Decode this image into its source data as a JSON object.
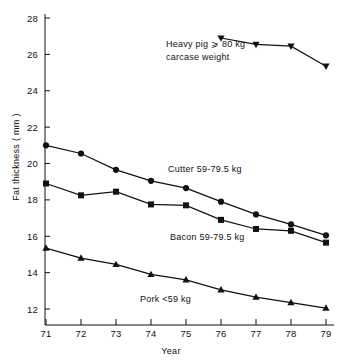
{
  "chart_data": {
    "type": "line",
    "title": "",
    "xlabel": "Year",
    "ylabel": "Fat thickness ( mm )",
    "x": [
      71,
      72,
      73,
      74,
      75,
      76,
      77,
      78,
      79
    ],
    "xticklabels": [
      "71",
      "72",
      "73",
      "74",
      "75",
      "76",
      "77",
      "78",
      "79"
    ],
    "xlim": [
      70.6,
      79.4
    ],
    "ylim": [
      11.2,
      28.4
    ],
    "yticks": [
      12,
      14,
      16,
      18,
      20,
      22,
      24,
      26,
      28
    ],
    "yticklabels": [
      "12",
      "14",
      "16",
      "18",
      "20",
      "22",
      "24",
      "26",
      "28"
    ],
    "grid": false,
    "legend": "annotations-on-plot",
    "line_color": "#111111",
    "series": [
      {
        "name": "Heavy pig ⩾ 80 kg carcase weight",
        "marker": "triangle-down",
        "x": [
          76,
          77,
          78,
          79
        ],
        "values": [
          26.9,
          26.55,
          26.45,
          25.35
        ],
        "label_lines": [
          "Heavy pig ⩾ 80 kg",
          "carcase  weight"
        ]
      },
      {
        "name": "Cutter 59-79.5 kg",
        "marker": "circle",
        "x": [
          71,
          72,
          73,
          74,
          75,
          76,
          77,
          78,
          79
        ],
        "values": [
          21.0,
          20.55,
          19.65,
          19.05,
          18.65,
          17.9,
          17.2,
          16.65,
          16.05
        ],
        "label_lines": [
          "Cutter 59-79.5 kg"
        ]
      },
      {
        "name": "Bacon 59-79.5 kg",
        "marker": "square",
        "x": [
          71,
          72,
          73,
          74,
          75,
          76,
          77,
          78,
          79
        ],
        "values": [
          18.9,
          18.25,
          18.45,
          17.75,
          17.7,
          16.9,
          16.4,
          16.3,
          15.65
        ],
        "label_lines": [
          "Bacon 59-79.5 kg"
        ]
      },
      {
        "name": "Pork <59 kg",
        "marker": "triangle-up",
        "x": [
          71,
          72,
          73,
          74,
          75,
          76,
          77,
          78,
          79
        ],
        "values": [
          15.35,
          14.8,
          14.45,
          13.9,
          13.6,
          13.05,
          12.65,
          12.35,
          12.05
        ],
        "label_lines": [
          "Pork <59 kg"
        ]
      }
    ],
    "annotations": [
      {
        "id": "heavy-pig-label",
        "text": "Heavy pig ⩾ 80 kg",
        "x_px": 166,
        "y_px": 47
      },
      {
        "id": "heavy-pig-label-2",
        "text": "carcase  weight",
        "x_px": 166,
        "y_px": 60
      },
      {
        "id": "cutter-label",
        "text": "Cutter 59-79.5 kg",
        "x_px": 168,
        "y_px": 172
      },
      {
        "id": "bacon-label",
        "text": "Bacon 59-79.5 kg",
        "x_px": 170,
        "y_px": 240
      },
      {
        "id": "pork-label",
        "text": "Pork <59 kg",
        "x_px": 140,
        "y_px": 302
      }
    ]
  }
}
